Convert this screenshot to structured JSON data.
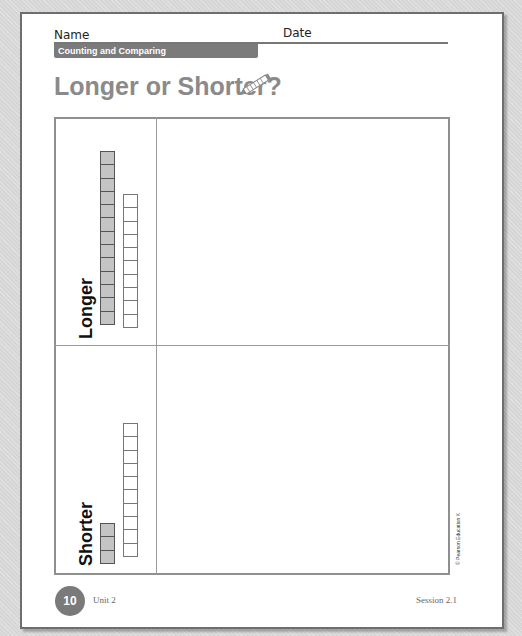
{
  "header": {
    "name_label": "Name",
    "date_label": "Date",
    "band_label": "Counting and Comparing"
  },
  "title": "Longer or Shorter?",
  "title_icon": "pencil-icon",
  "sections": [
    {
      "label": "Longer",
      "towers": [
        {
          "color": "gray",
          "cubes": 13
        },
        {
          "color": "white",
          "cubes": 10
        }
      ]
    },
    {
      "label": "Shorter",
      "towers": [
        {
          "color": "gray",
          "cubes": 3
        },
        {
          "color": "white",
          "cubes": 10
        }
      ]
    }
  ],
  "footer": {
    "page_number": "10",
    "unit": "Unit 2",
    "session": "Session 2.1",
    "copyright": "© Pearson Education K"
  },
  "colors": {
    "band": "#7b7b7b",
    "title": "#8a8a8a",
    "cube_gray": "#c4c4c4",
    "page_circle": "#7a7a7a"
  }
}
